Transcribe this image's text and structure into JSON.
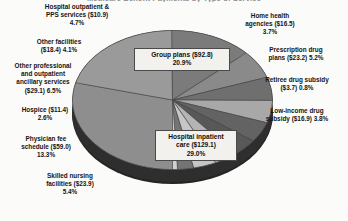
{
  "title_fragment": "Medicare Benefit Payments by Type of Service",
  "chart_data": {
    "type": "pie",
    "title": "Medicare Benefit Payments by Type of Service",
    "xlabel": "",
    "ylabel": "",
    "grid": false,
    "legend_position": "none",
    "units": "billions of dollars",
    "categories": [
      "Hospital inpatient care",
      "Group plans",
      "Physician fee schedule",
      "Other professional and outpatient ancillary services",
      "Skilled nursing facilities",
      "Prescription drug plans",
      "Hospital outpatient & PPS services",
      "Other facilities",
      "Low-income drug subsidy",
      "Home health agencies",
      "Hospice",
      "Retiree drug subsidy"
    ],
    "values": [
      129.1,
      92.8,
      59.0,
      29.1,
      23.9,
      23.2,
      10.9,
      18.4,
      16.9,
      16.5,
      11.4,
      3.7
    ],
    "percentages": [
      29.0,
      20.9,
      13.3,
      6.5,
      5.4,
      5.2,
      4.7,
      4.1,
      3.8,
      3.7,
      2.6,
      0.8
    ],
    "slice_colors": [
      "#8e8e8e",
      "#9a9a9a",
      "#7b7b7b",
      "#8a8a8a",
      "#6f6f6f",
      "#a8a8a8",
      "#636363",
      "#585858",
      "#b4b4b4",
      "#c6c6c6",
      "#747474",
      "#d2d2d2"
    ]
  },
  "labels": {
    "hospital_outpatient": "Hospital outpatient &\nPPS services ($10.9)\n4.7%",
    "other_facilities": "Other facilities\n($18.4) 4.1%",
    "other_professional": "Other professional\nand outpatient\nancillary services\n($29.1) 6.5%",
    "hospice": "Hospice ($11.4)\n2.6%",
    "physician_fee": "Physician fee\nschedule ($59.0)\n13.3%",
    "skilled_nursing": "Skilled nursing\nfacilities ($23.9)\n5.4%",
    "home_health": "Home health\nagencies ($16.5)\n3.7%",
    "prescription_drug": "Prescription drug\nplans ($23.2) 5.2%",
    "retiree_drug": "Retiree drug subsidy\n($3.7) 0.8%",
    "low_income_drug": "Low-income drug\nsubsidy ($16.9) 3.8%",
    "group_plans": "Group plans ($92.8)\n20.9%",
    "hospital_inpatient": "Hospital inpatient\ncare ($129.1)\n29.0%"
  }
}
